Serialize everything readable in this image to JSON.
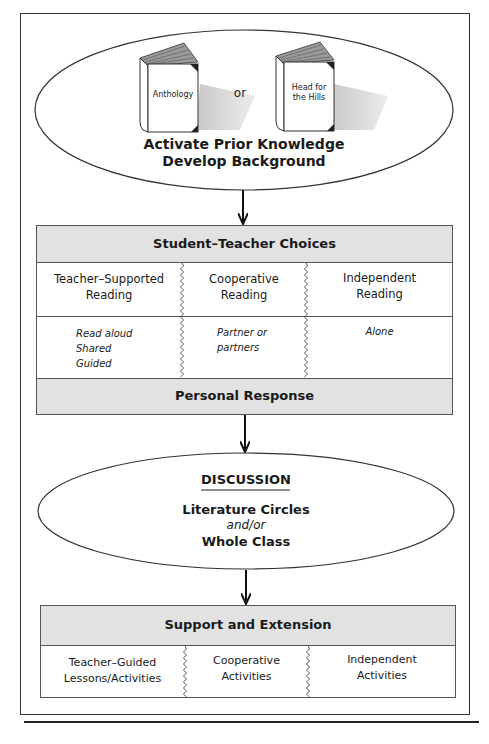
{
  "diagram": {
    "top_node": {
      "books": [
        {
          "label_line1": "Anthology",
          "label_line2": ""
        },
        {
          "label_line1": "Head for",
          "label_line2": "the Hills"
        }
      ],
      "connector": "or",
      "title_line1": "Activate Prior Knowledge",
      "title_line2": "Develop Background"
    },
    "choices_box": {
      "header": "Student–Teacher Choices",
      "columns": [
        {
          "title_line1": "Teacher–Supported",
          "title_line2": "Reading",
          "details": [
            "Read aloud",
            "Shared",
            "Guided"
          ]
        },
        {
          "title_line1": "Cooperative",
          "title_line2": "Reading",
          "details": [
            "Partner or",
            "partners"
          ]
        },
        {
          "title_line1": "Independent",
          "title_line2": "Reading",
          "details": [
            "Alone"
          ]
        }
      ],
      "footer": "Personal Response"
    },
    "discussion_node": {
      "heading": "DISCUSSION",
      "line1": "Literature Circles",
      "line2": "and/or",
      "line3": "Whole Class"
    },
    "support_box": {
      "header": "Support and Extension",
      "columns": [
        {
          "line1": "Teacher–Guided",
          "line2": "Lessons/Activities"
        },
        {
          "line1": "Cooperative",
          "line2": "Activities"
        },
        {
          "line1": "Independent",
          "line2": "Activities"
        }
      ]
    },
    "colors": {
      "gray_band": "#e2e2e2",
      "line": "#333333",
      "text": "#1a1a1a"
    }
  }
}
